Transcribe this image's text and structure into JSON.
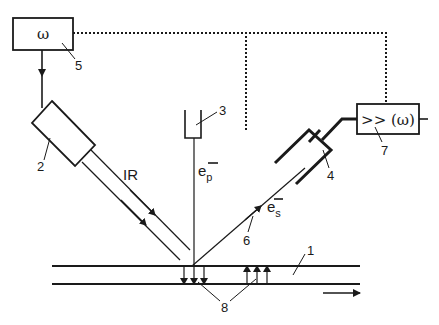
{
  "diagram": {
    "type": "schematic",
    "colors": {
      "ink": "#1a1a1a",
      "background": "#ffffff"
    },
    "components": {
      "sample": {
        "number": "1"
      },
      "ir_source": {
        "number": "2"
      },
      "electron_gun": {
        "number": "3"
      },
      "electron_detector": {
        "number": "4"
      },
      "modulator": {
        "number": "5",
        "label": "ω"
      },
      "secondary_beam": {
        "number": "6"
      },
      "lock_in_amplifier": {
        "number": "7",
        "label": ">> (ω)"
      },
      "surface_charges": {
        "number": "8"
      }
    },
    "beam_labels": {
      "ir": "IR",
      "primary_electron": "e",
      "primary_sub": "p",
      "secondary_electron": "e",
      "secondary_sub": "s",
      "charge_sign": "−"
    },
    "connections": [
      {
        "from": "modulator",
        "to": "ir_source",
        "style": "solid-arrow"
      },
      {
        "from": "modulator",
        "to": "lock_in_amplifier",
        "style": "dotted"
      },
      {
        "from": "electron_detector",
        "to": "lock_in_amplifier",
        "style": "solid"
      }
    ],
    "motion_arrow": "sample moves right"
  }
}
